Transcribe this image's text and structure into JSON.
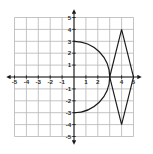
{
  "chart_data": {
    "type": "line",
    "title": "",
    "xlabel": "",
    "ylabel": "",
    "xlim": [
      -5,
      5
    ],
    "ylim": [
      -5,
      5
    ],
    "grid": true,
    "legend_position": "none",
    "axis_color": "#1a1a1a",
    "grid_color": "#b9b9b9",
    "curve_color": "#1a1a1a",
    "background": "#ffffff",
    "x_tick_labels": [
      "-5",
      "-4",
      "-3",
      "-2",
      "-1",
      "1",
      "2",
      "4",
      "5"
    ],
    "x_tick_values": [
      -5,
      -4,
      -3,
      -2,
      -1,
      1,
      2,
      4,
      5
    ],
    "y_tick_labels": [
      "5",
      "4",
      "3",
      "2",
      "1",
      "-1",
      "-2",
      "-3",
      "-4",
      "-5"
    ],
    "y_tick_values": [
      5,
      4,
      3,
      2,
      1,
      -1,
      -2,
      -3,
      -4,
      -5
    ],
    "series": [
      {
        "name": "semicircle-arc",
        "shape": "semicircle",
        "center": [
          0,
          0
        ],
        "radius": 3,
        "half": "right",
        "endpoints": [
          [
            0,
            3
          ],
          [
            0,
            -3
          ]
        ],
        "rightmost_point": [
          3,
          0
        ]
      },
      {
        "name": "diamond",
        "shape": "polygon",
        "closed": true,
        "vertices": [
          [
            3,
            0
          ],
          [
            4,
            4
          ],
          [
            5,
            0
          ],
          [
            4,
            -4
          ]
        ]
      }
    ]
  }
}
